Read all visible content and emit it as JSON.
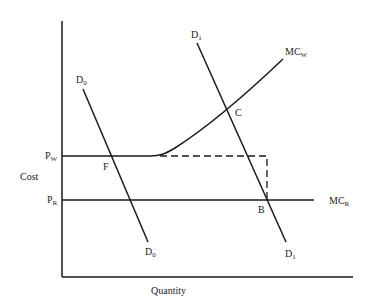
{
  "diagram": {
    "axes": {
      "y_label": "Cost",
      "x_label": "Quantity"
    },
    "price_labels": {
      "pw": {
        "main": "P",
        "sub": "W"
      },
      "pr": {
        "main": "P",
        "sub": "R"
      }
    },
    "curves": {
      "d0_top": {
        "main": "D",
        "sub": "0"
      },
      "d0_bottom": {
        "main": "D",
        "sub": "0"
      },
      "d1_top": {
        "main": "D",
        "sub": "1"
      },
      "d1_bottom": {
        "main": "D",
        "sub": "1"
      },
      "mcw": {
        "main": "MC",
        "sub": "W"
      },
      "mcr": {
        "main": "MC",
        "sub": "R"
      }
    },
    "points": {
      "f": "F",
      "c": "C",
      "b": "B"
    },
    "colors": {
      "line": "#1a1a1a",
      "text": "#222222",
      "background": "#ffffff"
    }
  }
}
